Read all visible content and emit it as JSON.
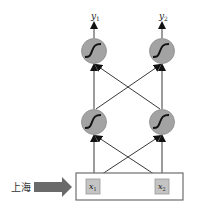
{
  "diagram": {
    "type": "neural-network",
    "input_word": "上海",
    "input_layer": {
      "nodes": [
        {
          "id": "x1",
          "label": "x",
          "subscript": "1"
        },
        {
          "id": "x2",
          "label": "x",
          "subscript": "2"
        }
      ]
    },
    "hidden_layer": {
      "activation": "sigmoid",
      "nodes": [
        {
          "id": "h1"
        },
        {
          "id": "h2"
        }
      ]
    },
    "output_layer": {
      "activation": "sigmoid",
      "nodes": [
        {
          "id": "y1",
          "label": "y",
          "subscript": "1"
        },
        {
          "id": "y2",
          "label": "y",
          "subscript": "2"
        }
      ]
    },
    "connections": "fully-connected",
    "colors": {
      "node_fill": "#a3a3a3",
      "node_stroke": "#8a8a8a",
      "curve": "#111111",
      "edge": "#222222",
      "input_box_stroke": "#6e6e6e",
      "input_cell_fill": "#c4c4c4",
      "input_cell_stroke": "#9a9a9a",
      "arrow_fill": "#6a6a6a"
    }
  }
}
